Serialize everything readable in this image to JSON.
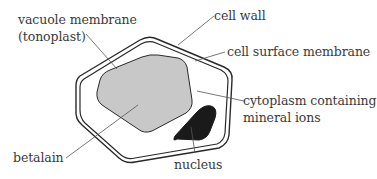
{
  "diagram": {
    "type": "plant cell diagram",
    "labels": {
      "vacuole_membrane_line1": "vacuole membrane",
      "vacuole_membrane_line2": "(tonoplast)",
      "cell_wall": "cell wall",
      "cell_surface_membrane": "cell surface membrane",
      "cytoplasm_line1": "cytoplasm containing",
      "cytoplasm_line2": "mineral ions",
      "betalain": "betalain",
      "nucleus": "nucleus"
    },
    "colors": {
      "outline": "#2a2a2a",
      "vacuole_fill": "#c8c8c8",
      "nucleus_fill": "#1a1a1a",
      "leader_line": "#555555",
      "text": "#3a3a3a",
      "background": "#ffffff"
    }
  }
}
